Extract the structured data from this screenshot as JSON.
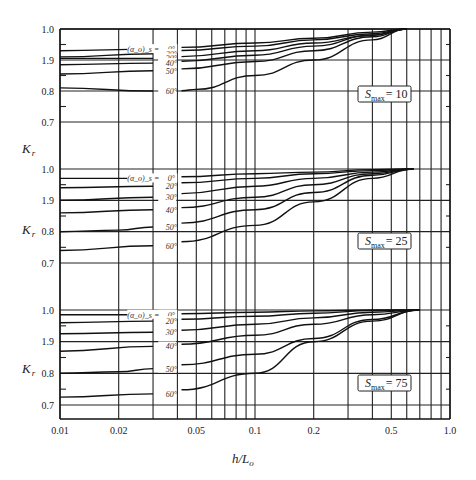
{
  "chart_data": {
    "type": "line",
    "title": "",
    "xlabel": "h/L_o",
    "xlabel_main": "h/L",
    "xlabel_sub": "o",
    "ylabel": "K_r",
    "ylabel_main": "K",
    "ylabel_sub": "r",
    "xscale": "log",
    "xlim": [
      0.01,
      1.0
    ],
    "x_ticks": [
      0.01,
      0.02,
      0.05,
      0.1,
      0.2,
      0.5,
      1.0
    ],
    "x_tick_labels": [
      "0.01",
      "0.02",
      "0.05",
      "0.1",
      "0.2",
      "0.5",
      "1.0"
    ],
    "x_gridlines": [
      0.01,
      0.02,
      0.03,
      0.04,
      0.05,
      0.06,
      0.07,
      0.08,
      0.09,
      0.1,
      0.2,
      0.3,
      0.4,
      0.5,
      0.6,
      0.7,
      0.8,
      0.9,
      1.0
    ],
    "y_ticks": [
      1.0,
      0.9,
      0.8,
      0.7
    ],
    "y_tick_labels": [
      "1.0",
      "1.9",
      "0.8",
      "0.7"
    ],
    "y_minor_ticks": [
      0.95,
      0.85,
      0.75
    ],
    "grid": true,
    "legend_position": "inline labels at h/L_o ≈ 0.03–0.035",
    "angle_label_prefix": "(α_o)_s =",
    "panels": [
      {
        "annotation": "S_max = 10",
        "annotation_main": "S",
        "annotation_sub": "max",
        "annotation_value": "= 10",
        "ylim": [
          0.7,
          1.0
        ],
        "series": [
          {
            "name": "0°",
            "label": "0°",
            "x": [
              0.01,
              0.03,
              0.04,
              0.1,
              0.2,
              0.4,
              0.6
            ],
            "values": [
              0.93,
              0.935,
              0.94,
              0.955,
              0.97,
              0.99,
              1.0
            ]
          },
          {
            "name": "20°",
            "label": "20°",
            "x": [
              0.01,
              0.03,
              0.04,
              0.1,
              0.2,
              0.4,
              0.6
            ],
            "values": [
              0.91,
              0.92,
              0.93,
              0.945,
              0.965,
              0.985,
              1.0
            ]
          },
          {
            "name": "30°",
            "label": "30°",
            "x": [
              0.01,
              0.03,
              0.04,
              0.1,
              0.2,
              0.4,
              0.6
            ],
            "values": [
              0.905,
              0.905,
              0.91,
              0.93,
              0.955,
              0.98,
              1.0
            ]
          },
          {
            "name": "40°",
            "label": "40°",
            "x": [
              0.01,
              0.03,
              0.04,
              0.1,
              0.2,
              0.4,
              0.6
            ],
            "values": [
              0.885,
              0.89,
              0.895,
              0.915,
              0.945,
              0.98,
              1.0
            ]
          },
          {
            "name": "50°",
            "label": "50°",
            "x": [
              0.01,
              0.03,
              0.04,
              0.1,
              0.2,
              0.4,
              0.6
            ],
            "values": [
              0.855,
              0.865,
              0.87,
              0.895,
              0.93,
              0.975,
              1.0
            ]
          },
          {
            "name": "60°",
            "label": "60°",
            "x": [
              0.01,
              0.03,
              0.04,
              0.05,
              0.1,
              0.2,
              0.4,
              0.6
            ],
            "values": [
              0.81,
              0.8,
              0.8,
              0.805,
              0.85,
              0.9,
              0.965,
              1.0
            ]
          }
        ]
      },
      {
        "annotation": "S_max = 25",
        "annotation_main": "S",
        "annotation_sub": "max",
        "annotation_value": "= 25",
        "ylim": [
          0.7,
          1.0
        ],
        "series": [
          {
            "name": "0°",
            "label": "0°",
            "x": [
              0.01,
              0.03,
              0.04,
              0.1,
              0.2,
              0.4,
              0.65
            ],
            "values": [
              0.97,
              0.97,
              0.975,
              0.985,
              0.99,
              0.998,
              1.0
            ]
          },
          {
            "name": "20°",
            "label": "20°",
            "x": [
              0.01,
              0.03,
              0.04,
              0.1,
              0.2,
              0.4,
              0.65
            ],
            "values": [
              0.94,
              0.945,
              0.955,
              0.97,
              0.985,
              0.995,
              1.0
            ]
          },
          {
            "name": "30°",
            "label": "30°",
            "x": [
              0.01,
              0.03,
              0.04,
              0.1,
              0.2,
              0.4,
              0.65
            ],
            "values": [
              0.9,
              0.91,
              0.92,
              0.945,
              0.97,
              0.99,
              1.0
            ]
          },
          {
            "name": "40°",
            "label": "40°",
            "x": [
              0.01,
              0.03,
              0.04,
              0.1,
              0.2,
              0.4,
              0.65
            ],
            "values": [
              0.86,
              0.87,
              0.875,
              0.91,
              0.95,
              0.985,
              1.0
            ]
          },
          {
            "name": "50°",
            "label": "50°",
            "x": [
              0.01,
              0.02,
              0.03,
              0.04,
              0.1,
              0.2,
              0.4,
              0.65
            ],
            "values": [
              0.8,
              0.805,
              0.815,
              0.825,
              0.87,
              0.925,
              0.98,
              1.0
            ]
          },
          {
            "name": "60°",
            "label": "60°",
            "x": [
              0.01,
              0.03,
              0.04,
              0.1,
              0.2,
              0.4,
              0.65
            ],
            "values": [
              0.74,
              0.755,
              0.765,
              0.82,
              0.895,
              0.97,
              1.0
            ]
          }
        ]
      },
      {
        "annotation": "S_max = 75",
        "annotation_main": "S",
        "annotation_sub": "max",
        "annotation_value": "= 75",
        "ylim": [
          0.66,
          1.0
        ],
        "series": [
          {
            "name": "0°",
            "label": "0°",
            "x": [
              0.01,
              0.03,
              0.04,
              0.1,
              0.2,
              0.4,
              0.7
            ],
            "values": [
              0.985,
              0.985,
              0.988,
              0.993,
              0.997,
              1.0,
              1.0
            ]
          },
          {
            "name": "20°",
            "label": "20°",
            "x": [
              0.01,
              0.03,
              0.04,
              0.1,
              0.2,
              0.4,
              0.7
            ],
            "values": [
              0.96,
              0.965,
              0.97,
              0.98,
              0.99,
              0.998,
              1.0
            ]
          },
          {
            "name": "30°",
            "label": "30°",
            "x": [
              0.01,
              0.03,
              0.04,
              0.1,
              0.2,
              0.4,
              0.7
            ],
            "values": [
              0.925,
              0.93,
              0.935,
              0.955,
              0.975,
              0.993,
              1.0
            ]
          },
          {
            "name": "40°",
            "label": "40°",
            "x": [
              0.01,
              0.03,
              0.04,
              0.1,
              0.2,
              0.4,
              0.7
            ],
            "values": [
              0.87,
              0.885,
              0.89,
              0.92,
              0.955,
              0.985,
              1.0
            ]
          },
          {
            "name": "50°",
            "label": "50°",
            "x": [
              0.01,
              0.02,
              0.03,
              0.04,
              0.1,
              0.2,
              0.4,
              0.7
            ],
            "values": [
              0.8,
              0.805,
              0.815,
              0.825,
              0.86,
              0.91,
              0.97,
              1.0
            ]
          },
          {
            "name": "60°",
            "label": "60°",
            "x": [
              0.01,
              0.03,
              0.04,
              0.1,
              0.2,
              0.4,
              0.7
            ],
            "values": [
              0.725,
              0.735,
              0.745,
              0.8,
              0.9,
              0.965,
              1.0
            ]
          }
        ]
      }
    ]
  },
  "layout_px": {
    "plot_left": 60,
    "plot_right": 450,
    "panels": [
      {
        "y_top": 29,
        "y_bottom": 150,
        "y1": 29,
        "y07": 122,
        "label_y": 153,
        "smax_box": [
          358,
          86,
          53,
          16
        ]
      },
      {
        "y_top": 150,
        "y_bottom": 290,
        "y1": 169,
        "y07": 263,
        "label_y": 234,
        "smax_box": [
          358,
          233,
          53,
          16
        ]
      },
      {
        "y_top": 290,
        "y_bottom": 419,
        "y1": 310,
        "y07": 405,
        "label_y": 373,
        "smax_box": [
          358,
          375,
          53,
          16
        ]
      }
    ],
    "angle_label_x": 161,
    "curve_gap": [
      0.03,
      0.042
    ]
  }
}
